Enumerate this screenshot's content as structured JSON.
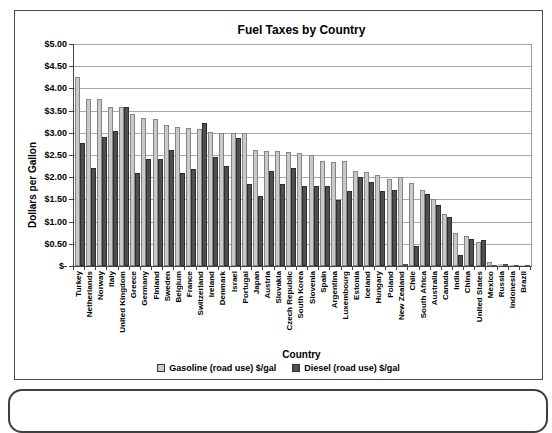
{
  "chart_data": {
    "type": "bar",
    "title": "Fuel Taxes by Country",
    "xlabel": "Country",
    "ylabel": "Dollars per Gallon",
    "ylim": [
      0,
      5
    ],
    "grid": true,
    "legend_position": "bottom",
    "ytick_labels": [
      "$-",
      "$0.50",
      "$1.00",
      "$1.50",
      "$2.00",
      "$2.50",
      "$3.00",
      "$3.50",
      "$4.00",
      "$4.50",
      "$5.00"
    ],
    "categories": [
      "Turkey",
      "Netherlands",
      "Norway",
      "Italy",
      "United Kingdom",
      "Greece",
      "Germany",
      "Finland",
      "Sweden",
      "Belgium",
      "France",
      "Switzerland",
      "Ireland",
      "Denmark",
      "Israel",
      "Portugal",
      "Japan",
      "Austria",
      "Slovakia",
      "Czech Republic",
      "South Korea",
      "Slovenia",
      "Spain",
      "Argentina",
      "Luxembourg",
      "Estonia",
      "Iceland",
      "Hungary",
      "Poland",
      "New Zealand",
      "Chile",
      "South Africa",
      "Australia",
      "Canada",
      "India",
      "China",
      "United States",
      "Mexico",
      "Russia",
      "Indonesia",
      "Brazil"
    ],
    "series": [
      {
        "name": "Gasoline (road use) $/gal",
        "color": "#c9c9c9",
        "values": [
          4.25,
          3.77,
          3.77,
          3.58,
          3.58,
          3.43,
          3.33,
          3.32,
          3.18,
          3.12,
          3.1,
          3.08,
          3.02,
          3.0,
          3.0,
          3.0,
          2.61,
          2.6,
          2.6,
          2.56,
          2.54,
          2.51,
          2.37,
          2.35,
          2.36,
          2.15,
          2.11,
          2.05,
          1.95,
          2.0,
          1.87,
          1.72,
          1.51,
          1.16,
          0.74,
          0.67,
          0.53,
          0.08,
          0.05,
          0.03,
          0.02
        ]
      },
      {
        "name": "Diesel (road use) $/gal",
        "color": "#4f4f4f",
        "values": [
          2.78,
          2.2,
          2.9,
          3.03,
          3.57,
          2.1,
          2.4,
          2.4,
          2.62,
          2.1,
          2.18,
          3.23,
          2.45,
          2.25,
          2.88,
          1.85,
          1.58,
          2.15,
          1.85,
          2.2,
          1.81,
          1.8,
          1.81,
          1.49,
          1.7,
          2.0,
          1.9,
          1.7,
          1.71,
          0.04,
          0.44,
          1.63,
          1.38,
          1.1,
          0.25,
          0.6,
          0.58,
          0.03,
          0.04,
          0.02,
          0.01
        ]
      }
    ]
  }
}
